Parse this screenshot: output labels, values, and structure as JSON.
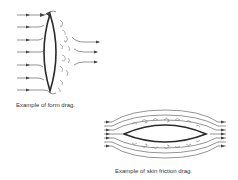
{
  "figures": [
    {
      "id": "form-drag",
      "caption": "Example of form drag."
    },
    {
      "id": "skin-friction-drag",
      "caption": "Example of skin friction drag."
    }
  ],
  "colors": {
    "line": "#555555",
    "body": "#333333",
    "background": "#ffffff"
  }
}
